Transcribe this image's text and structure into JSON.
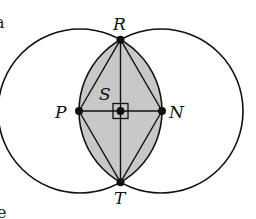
{
  "diagram": {
    "title": "",
    "colors": {
      "stroke": "#111111",
      "shade": "#c8c8c8",
      "background": "#ffffff"
    },
    "circles": [
      {
        "name": "left-circle",
        "cx": 80,
        "cy": 111,
        "r": 82
      },
      {
        "name": "right-circle",
        "cx": 161,
        "cy": 111,
        "r": 82
      }
    ],
    "points": {
      "R": {
        "label": "R",
        "x": 120.5,
        "y": 39
      },
      "T": {
        "label": "T",
        "x": 120.5,
        "y": 184
      },
      "P": {
        "label": "P",
        "x": 79,
        "y": 111
      },
      "N": {
        "label": "N",
        "x": 162,
        "y": 111
      },
      "S": {
        "label": "S",
        "x": 120.5,
        "y": 111
      }
    },
    "segments": [
      "RP",
      "PT",
      "RN",
      "NT",
      "RT",
      "PN"
    ],
    "shaded_region": "lens (intersection of the two circles)",
    "right_angle_marker_at": "S",
    "edge_text_fragments": {
      "top_left": "a",
      "bottom_left": "e"
    }
  }
}
